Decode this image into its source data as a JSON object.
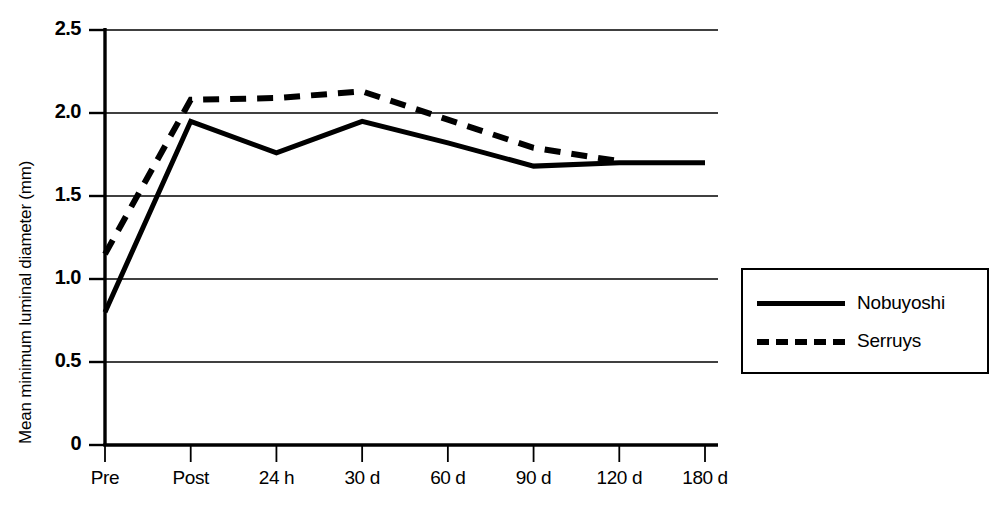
{
  "chart_data": {
    "type": "line",
    "title": "",
    "xlabel": "",
    "ylabel": "Mean minimum luminal diameter (mm)",
    "categories": [
      "Pre",
      "Post",
      "24 h",
      "30 d",
      "60 d",
      "90 d",
      "120 d",
      "180 d"
    ],
    "ytick_labels": [
      "2.5",
      "2.0",
      "1.5",
      "1.0",
      "0.5",
      "0"
    ],
    "ytick_values": [
      2.5,
      2.0,
      1.5,
      1.0,
      0.5,
      0
    ],
    "ylim": [
      0,
      2.5
    ],
    "grid": "horizontal",
    "legend_position": "right",
    "series": [
      {
        "name": "Nobuyoshi",
        "style": "solid",
        "color": "#000000",
        "values": [
          0.8,
          1.95,
          1.76,
          1.95,
          1.82,
          1.68,
          1.7,
          1.7
        ]
      },
      {
        "name": "Serruys",
        "style": "dashed",
        "color": "#000000",
        "values": [
          1.15,
          2.08,
          2.09,
          2.13,
          1.96,
          1.79,
          1.71,
          null
        ]
      }
    ]
  },
  "legend": {
    "items": [
      {
        "label": "Nobuyoshi",
        "style": "solid"
      },
      {
        "label": "Serruys",
        "style": "dashed"
      }
    ]
  }
}
